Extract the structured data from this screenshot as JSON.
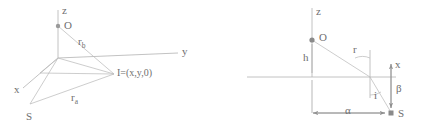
{
  "figure": {
    "type": "geometry-diagram",
    "background_color": "#ffffff",
    "stroke_color": "#a9a9a9",
    "text_color": "#6f6f6f",
    "panels": [
      {
        "id": "left",
        "name": "3d-coordinate-diagram",
        "description": "3D cartesian axes with source point S, image point I and origin O",
        "axis_labels": {
          "z": "z",
          "y": "y",
          "x": "x"
        },
        "points": [
          {
            "name": "origin-point",
            "label": "O"
          },
          {
            "name": "image-point",
            "label": "I=(x,y,0)"
          },
          {
            "name": "source-point",
            "label": "S"
          }
        ],
        "segments": [
          {
            "name": "rb-segment",
            "label": "r",
            "subscript": "b"
          },
          {
            "name": "ra-segment",
            "label": "r",
            "subscript": "a"
          }
        ]
      },
      {
        "id": "right",
        "name": "2d-section-diagram",
        "description": "Vertical section showing height h, distance r, angles i and beta, horizontal offset alpha",
        "axis_labels": {
          "z": "z",
          "x": "x"
        },
        "points": [
          {
            "name": "origin-point",
            "label": "O"
          },
          {
            "name": "source-point",
            "label": "S"
          }
        ],
        "measures": [
          {
            "name": "height-label",
            "label": "h"
          },
          {
            "name": "radius-label",
            "label": "r"
          },
          {
            "name": "alpha-label",
            "label": "α"
          },
          {
            "name": "beta-label",
            "label": "β"
          },
          {
            "name": "incidence-angle-label",
            "label": "i"
          }
        ]
      }
    ]
  }
}
